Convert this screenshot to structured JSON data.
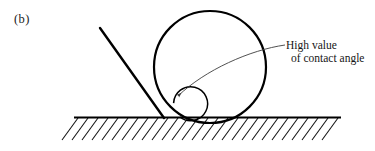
{
  "figure": {
    "panel_label": "(b)",
    "annotation": {
      "line1": "High value",
      "line2": "of contact angle"
    },
    "colors": {
      "ink": "#000000",
      "leader": "#4a4a4a",
      "background": "#ffffff"
    },
    "geometry": {
      "droplet_center_x": 210,
      "droplet_center_y": 67,
      "droplet_radius": 56,
      "contact_point_x": 163,
      "contact_point_y": 117,
      "baseline_y": 117,
      "baseline_x_start": 74,
      "baseline_x_end": 341,
      "tangent_start_x": 100,
      "tangent_start_y": 28,
      "angle_arc_radius": 17,
      "hatch_count": 27,
      "hatch_spacing": 10,
      "hatch_length": 20
    }
  }
}
